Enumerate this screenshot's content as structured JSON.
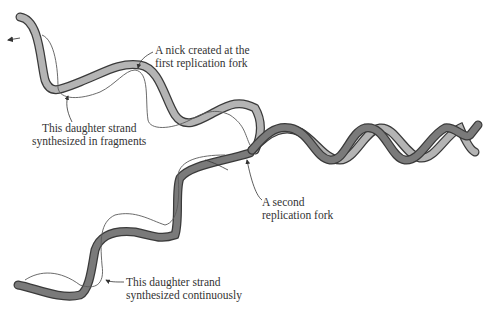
{
  "diagram": {
    "type": "dna-replication-illustration",
    "colors": {
      "light_strand": "#b4b4b4",
      "dark_strand": "#7a7a7a",
      "outline": "#3a3a3a",
      "daughter_line": "#5a5a5a",
      "text": "#333333"
    },
    "labels": {
      "nick": {
        "line1": "A nick created at the",
        "line2": "first replication fork"
      },
      "fragments": {
        "line1": "This daughter strand",
        "line2": "synthesized in fragments"
      },
      "second_fork": {
        "line1": "A second",
        "line2": "replication fork"
      },
      "continuous": {
        "line1": "This daughter strand",
        "line2": "synthesized continuously"
      }
    }
  }
}
